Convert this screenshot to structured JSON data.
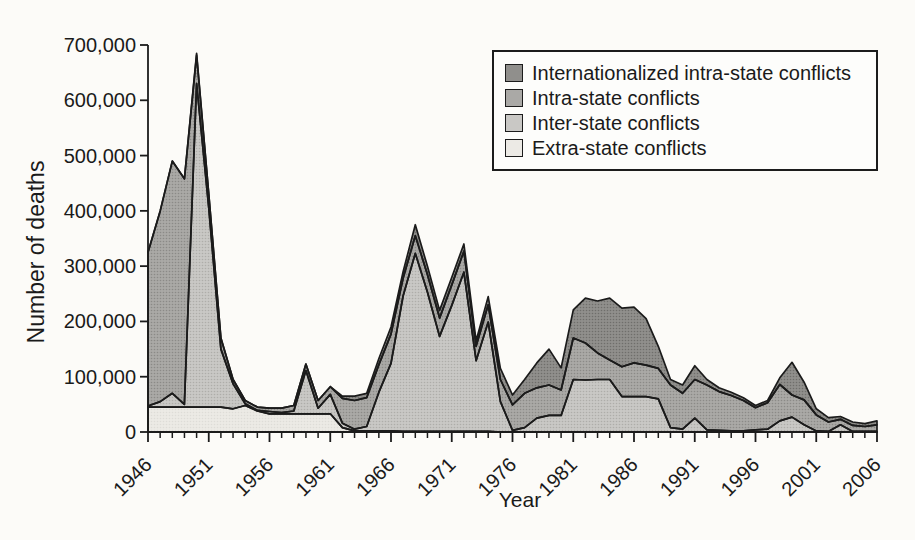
{
  "chart_data": {
    "type": "area",
    "stacked": true,
    "title": "",
    "xlabel": "Year",
    "ylabel": "Number of deaths",
    "xlim": [
      1946,
      2006
    ],
    "ylim": [
      0,
      700000
    ],
    "grid": false,
    "legend_position": "top-right",
    "x_ticks": [
      1946,
      1951,
      1956,
      1961,
      1966,
      1971,
      1976,
      1981,
      1986,
      1991,
      1996,
      2001,
      2006
    ],
    "y_tick_values": [
      0,
      100000,
      200000,
      300000,
      400000,
      500000,
      600000,
      700000
    ],
    "y_tick_labels": [
      "0",
      "100,000",
      "200,000",
      "300,000",
      "400,000",
      "500,000",
      "600,000",
      "700,000"
    ],
    "colors": {
      "outline": "#1b1b1b",
      "background": "#fcfbf8",
      "extra_state": "#eceae5",
      "inter_state": "#c9c8c5",
      "intra_state": "#aaa9a6",
      "internationalized": "#908f8c"
    },
    "series": [
      {
        "name": "Extra-state conflicts",
        "color": "#eceae5",
        "halftone_dot": "#dedcd7",
        "values": [
          45000,
          45000,
          45000,
          45000,
          45000,
          45000,
          45000,
          42000,
          48000,
          38000,
          33000,
          33000,
          33000,
          33000,
          33000,
          33000,
          8000,
          2000,
          2000,
          2000,
          2000,
          1000,
          1000,
          1000,
          1000,
          1000,
          1000,
          1000,
          1000,
          0,
          0,
          0,
          0,
          0,
          0,
          0,
          0,
          0,
          0,
          0,
          0,
          0,
          0,
          0,
          0,
          0,
          0,
          0,
          0,
          0,
          0,
          0,
          0,
          0,
          0,
          0,
          0,
          0,
          0,
          0,
          0
        ]
      },
      {
        "name": "Inter-state conflicts",
        "color": "#c9c8c5",
        "halftone_dot": "#aeada9",
        "values": [
          2000,
          10000,
          25000,
          5000,
          585000,
          360000,
          105000,
          45000,
          3000,
          1000,
          4000,
          2000,
          5000,
          78000,
          10000,
          35000,
          8000,
          3000,
          8000,
          70000,
          122000,
          245000,
          322000,
          252000,
          172000,
          228000,
          288000,
          128000,
          198000,
          55000,
          3000,
          8000,
          25000,
          30000,
          30000,
          95000,
          94000,
          95000,
          95000,
          64000,
          64000,
          64000,
          60000,
          8000,
          5000,
          25000,
          4000,
          3000,
          2000,
          2000,
          4000,
          5000,
          20000,
          27000,
          13000,
          2000,
          1000,
          13000,
          1000,
          1000,
          1000
        ]
      },
      {
        "name": "Intra-state conflicts",
        "color": "#aaa9a6",
        "halftone_dot": "#8b8a87",
        "values": [
          278000,
          345000,
          420000,
          408000,
          52000,
          25000,
          20000,
          8000,
          6000,
          6000,
          6000,
          8000,
          10000,
          12000,
          14000,
          14000,
          45000,
          52000,
          52000,
          50000,
          53000,
          32000,
          32000,
          32000,
          33000,
          37000,
          38000,
          26000,
          31000,
          40000,
          46000,
          62000,
          55000,
          55000,
          46000,
          75000,
          67000,
          48000,
          35000,
          54000,
          61000,
          57000,
          55000,
          77000,
          65000,
          70000,
          81000,
          70000,
          64000,
          55000,
          40000,
          48000,
          66000,
          40000,
          45000,
          29000,
          17000,
          10000,
          11000,
          9000,
          12000
        ]
      },
      {
        "name": "Internationalized intra-state conflicts",
        "color": "#908f8c",
        "halftone_dot": "#6f6e6b",
        "values": [
          0,
          0,
          0,
          0,
          3000,
          0,
          0,
          0,
          0,
          0,
          0,
          0,
          0,
          0,
          0,
          0,
          4000,
          8000,
          8000,
          11000,
          13000,
          12000,
          20000,
          15000,
          14000,
          14000,
          13000,
          10000,
          15000,
          20000,
          18000,
          25000,
          45000,
          65000,
          40000,
          51000,
          81000,
          94000,
          112000,
          106000,
          101000,
          84000,
          40000,
          10000,
          15000,
          25000,
          10000,
          7000,
          6000,
          5000,
          4000,
          4000,
          12000,
          59000,
          32000,
          11000,
          8000,
          5000,
          6000,
          5000,
          7000
        ]
      }
    ],
    "legend": [
      {
        "label": "Internationalized intra-state conflicts",
        "color": "#908f8c"
      },
      {
        "label": "Intra-state conflicts",
        "color": "#aaa9a6"
      },
      {
        "label": "Inter-state conflicts",
        "color": "#c9c8c5"
      },
      {
        "label": "Extra-state conflicts",
        "color": "#eceae5"
      }
    ]
  }
}
